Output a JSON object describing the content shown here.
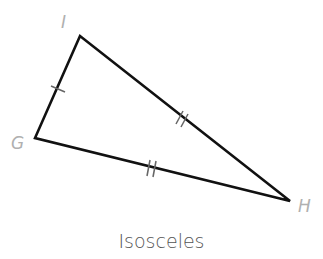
{
  "diagram": {
    "caption": "Isosceles",
    "vertices": [
      {
        "label": "I",
        "x": 80,
        "y": 36
      },
      {
        "label": "G",
        "x": 35,
        "y": 138
      },
      {
        "label": "H",
        "x": 290,
        "y": 201
      }
    ],
    "congruence_marks": [
      {
        "side": "GI",
        "ticks": 1
      },
      {
        "side": "IH",
        "ticks": 2
      },
      {
        "side": "GH",
        "ticks": 2
      }
    ],
    "colors": {
      "stroke": "#111111",
      "label": "#b0b0b0",
      "caption": "#555555",
      "ticks": "#666666"
    }
  }
}
